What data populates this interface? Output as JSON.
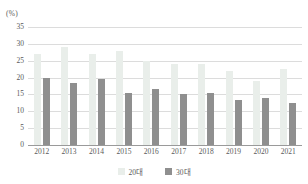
{
  "chart_data": {
    "type": "bar",
    "title": "",
    "xlabel": "",
    "ylabel": "(%)",
    "unit_label": "(%)",
    "ylim": [
      0,
      35
    ],
    "ytick_step": 5,
    "yticks": [
      "35",
      "30",
      "25",
      "20",
      "15",
      "10",
      "5",
      "0"
    ],
    "grid": true,
    "legend_position": "bottom-center",
    "categories": [
      "2012",
      "2013",
      "2014",
      "2015",
      "2016",
      "2017",
      "2018",
      "2019",
      "2020",
      "2021"
    ],
    "series": [
      {
        "name": "20대",
        "color": "#e9eeea",
        "values": [
          27.0,
          29.0,
          27.0,
          28.0,
          25.0,
          24.0,
          24.0,
          22.0,
          19.0,
          22.5
        ]
      },
      {
        "name": "30대",
        "color": "#8f8f8f",
        "values": [
          20.0,
          18.5,
          19.5,
          15.5,
          16.5,
          15.0,
          15.5,
          13.5,
          14.0,
          12.5
        ]
      }
    ]
  },
  "legend": {
    "items": [
      {
        "label": "20대",
        "color": "#e9eeea"
      },
      {
        "label": "30대",
        "color": "#8f8f8f"
      }
    ]
  }
}
